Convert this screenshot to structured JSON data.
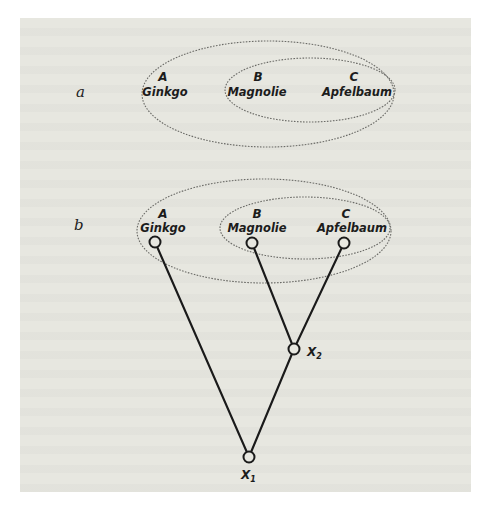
{
  "diagram": {
    "part_a": {
      "label": "a",
      "sets": [
        {
          "name": "outer-set",
          "members": [
            "A",
            "B",
            "C"
          ]
        },
        {
          "name": "inner-set",
          "members": [
            "B",
            "C"
          ]
        }
      ],
      "taxa": [
        {
          "letter": "A",
          "name": "Ginkgo"
        },
        {
          "letter": "B",
          "name": "Magnolie"
        },
        {
          "letter": "C",
          "name": "Apfelbaum"
        }
      ]
    },
    "part_b": {
      "label": "b",
      "taxa": [
        {
          "letter": "A",
          "name": "Ginkgo"
        },
        {
          "letter": "B",
          "name": "Magnolie"
        },
        {
          "letter": "C",
          "name": "Apfelbaum"
        }
      ],
      "ancestors": [
        {
          "symbol": "X",
          "subscript": "1"
        },
        {
          "symbol": "X",
          "subscript": "2"
        }
      ],
      "edges": [
        [
          "A",
          "X1"
        ],
        [
          "X2",
          "X1"
        ],
        [
          "B",
          "X2"
        ],
        [
          "C",
          "X2"
        ]
      ]
    }
  }
}
